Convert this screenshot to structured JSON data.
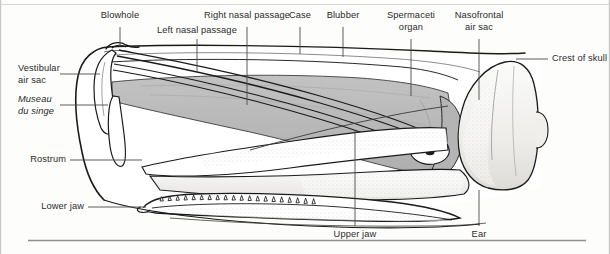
{
  "figure": {
    "style": "stippled line-art anatomical diagram",
    "background_color": "#fdfdfc",
    "ink_color": "#1a1a1a",
    "leader_color": "#4a4a4a",
    "spermaceti_fill": "#b9b9b9",
    "skull_fill": "#f2f1ef",
    "border_color": "#b5b5b5"
  },
  "labels": {
    "blowhole": "Blowhole",
    "left_nasal_passage": "Left nasal passage",
    "right_nasal_passage": "Right nasal passage",
    "case": "Case",
    "blubber": "Blubber",
    "spermaceti_organ_line1": "Spermaceti",
    "spermaceti_organ_line2": "organ",
    "nasofrontal_air_sac_line1": "Nasofrontal",
    "nasofrontal_air_sac_line2": "air sac",
    "crest_of_skull": "Crest of skull",
    "vestibular_air_sac_line1": "Vestibular",
    "vestibular_air_sac_line2": "air sac",
    "museau_du_singe_line1": "Museau",
    "museau_du_singe_line2": "du singe",
    "rostrum": "Rostrum",
    "lower_jaw": "Lower jaw",
    "upper_jaw": "Upper jaw",
    "ear": "Ear"
  },
  "callouts": [
    {
      "name": "blowhole",
      "text": "Blowhole",
      "side": "top",
      "anchor_x": 120,
      "anchor_y": 47
    },
    {
      "name": "left-nasal-passage",
      "text": "Left nasal passage",
      "side": "top",
      "anchor_x": 197,
      "anchor_y": 72
    },
    {
      "name": "right-nasal-passage",
      "text": "Right nasal passage",
      "side": "top",
      "anchor_x": 247,
      "anchor_y": 105
    },
    {
      "name": "case",
      "text": "Case",
      "side": "top",
      "anchor_x": 300,
      "anchor_y": 54
    },
    {
      "name": "blubber",
      "text": "Blubber",
      "side": "top",
      "anchor_x": 343,
      "anchor_y": 57
    },
    {
      "name": "spermaceti-organ",
      "text": "Spermaceti organ",
      "side": "top",
      "anchor_x": 411,
      "anchor_y": 96
    },
    {
      "name": "nasofrontal-air-sac",
      "text": "Nasofrontal air sac",
      "side": "top",
      "anchor_x": 479,
      "anchor_y": 100
    },
    {
      "name": "crest-of-skull",
      "text": "Crest of skull",
      "side": "right",
      "anchor_x": 516,
      "anchor_y": 59
    },
    {
      "name": "vestibular-air-sac",
      "text": "Vestibular air sac",
      "side": "left",
      "anchor_x": 89,
      "anchor_y": 74
    },
    {
      "name": "museau-du-singe",
      "text": "Museau du singe",
      "side": "left",
      "anchor_x": 102,
      "anchor_y": 105
    },
    {
      "name": "rostrum",
      "text": "Rostrum",
      "side": "left",
      "anchor_x": 137,
      "anchor_y": 160
    },
    {
      "name": "lower-jaw",
      "text": "Lower jaw",
      "side": "left",
      "anchor_x": 140,
      "anchor_y": 207
    },
    {
      "name": "upper-jaw",
      "text": "Upper jaw",
      "side": "bottom",
      "anchor_x": 355,
      "anchor_y": 131
    },
    {
      "name": "ear",
      "text": "Ear",
      "side": "bottom",
      "anchor_x": 479,
      "anchor_y": 158
    }
  ]
}
